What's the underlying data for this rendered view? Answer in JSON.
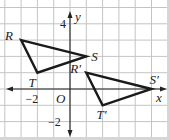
{
  "chart_data": {
    "type": "coordinate-grid",
    "title": "",
    "xlabel": "x",
    "ylabel": "y",
    "xlim": [
      -4,
      6
    ],
    "ylim": [
      -3,
      5
    ],
    "grid": true,
    "origin_label": "O",
    "tick_labels": [
      {
        "axis": "y",
        "value": 4,
        "text": "4"
      },
      {
        "axis": "x",
        "value": -2,
        "text": "−2"
      },
      {
        "axis": "y",
        "value": -2,
        "text": "−2"
      }
    ],
    "polygons": [
      {
        "name": "triangle-RST",
        "vertices": [
          {
            "label": "R",
            "x": -3,
            "y": 3
          },
          {
            "label": "S",
            "x": 1,
            "y": 2
          },
          {
            "label": "T",
            "x": -2,
            "y": 1
          }
        ]
      },
      {
        "name": "triangle-R'S'T'",
        "vertices": [
          {
            "label": "R′",
            "x": 1,
            "y": 1
          },
          {
            "label": "S′",
            "x": 5,
            "y": 0
          },
          {
            "label": "T′",
            "x": 2,
            "y": -1
          }
        ]
      }
    ]
  }
}
